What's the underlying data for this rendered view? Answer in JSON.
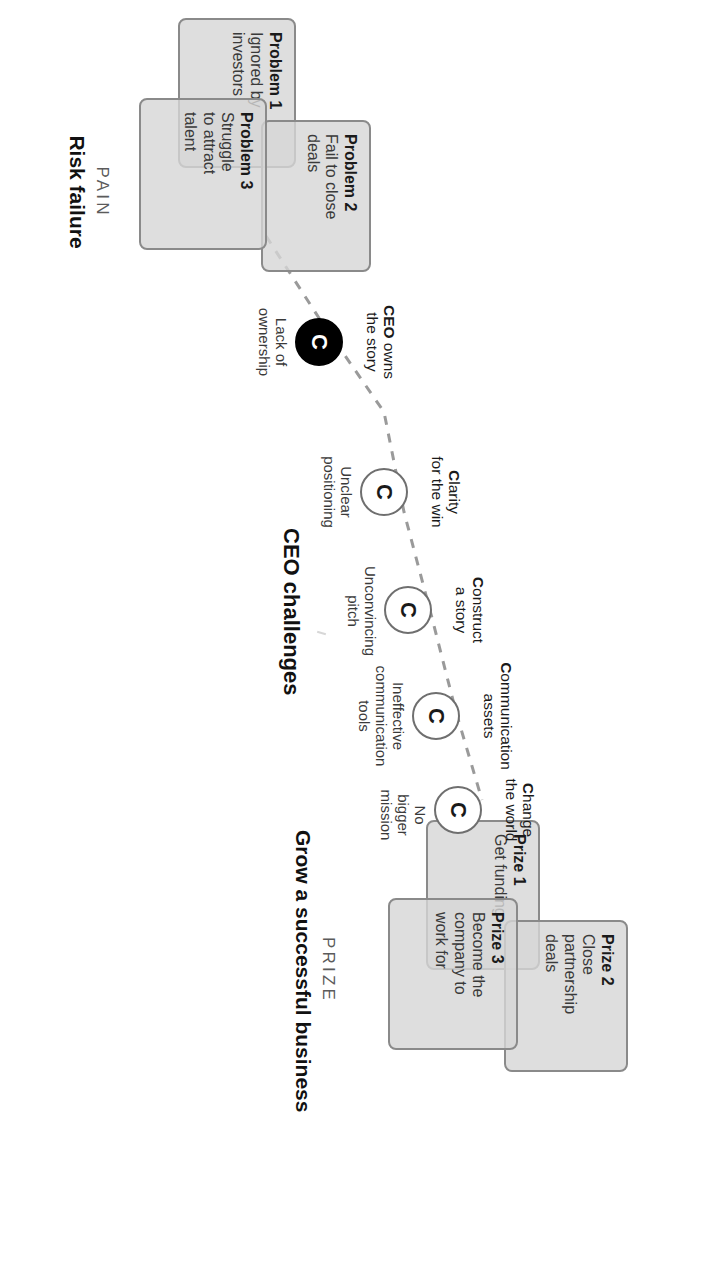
{
  "diagram": {
    "center_caption": "CEO challenges",
    "colors": {
      "card_fill": "#d6d6d6",
      "card_border": "#8a8a8a",
      "node_border": "#6f6f6f",
      "node_active_fill": "#000000",
      "connector": "#8f8f8f",
      "text": "#1a1a1a",
      "kicker": "#5b5b5b"
    },
    "nodes": [
      {
        "id": "ceo-owns-the-story",
        "glyph": "C",
        "filled": true,
        "label_lead": "CEO",
        "label_rest": " owns",
        "label_line2": "the story",
        "sub_line1": "Lack of",
        "sub_line2": "ownership"
      },
      {
        "id": "clarity-for-the-win",
        "glyph": "C",
        "filled": false,
        "label_lead": "C",
        "label_rest": "larity",
        "label_line2": "for the win",
        "sub_line1": "Unclear",
        "sub_line2": "positioning"
      },
      {
        "id": "construct-a-story",
        "glyph": "C",
        "filled": false,
        "label_lead": "C",
        "label_rest": "onstruct",
        "label_line2": "a story",
        "sub_line1": "Unconvincing",
        "sub_line2": "pitch"
      },
      {
        "id": "communication-assets",
        "glyph": "C",
        "filled": false,
        "label_lead": "C",
        "label_rest": "ommunication",
        "label_line2": "assets",
        "sub_line1": "Ineffective",
        "sub_line2": "communication",
        "sub_line3": "tools"
      },
      {
        "id": "change-the-world",
        "glyph": "C",
        "filled": false,
        "label_lead": "C",
        "label_rest": "hange",
        "label_line2": "the world",
        "sub_line1": "No",
        "sub_line2": "bigger",
        "sub_line3": "mission"
      }
    ],
    "pain": {
      "kicker": "PAIN",
      "headline": "Risk failure",
      "cards": [
        {
          "title": "Problem 1",
          "line1": "Ignored by",
          "line2": "investors"
        },
        {
          "title": "Problem 2",
          "line1": "Fail to close",
          "line2": "deals"
        },
        {
          "title": "Problem 3",
          "line1": "Struggle",
          "line2": "to attract",
          "line3": "talent"
        }
      ]
    },
    "prize": {
      "kicker": "PRIZE",
      "headline": "Grow a successful business",
      "cards": [
        {
          "title": "Prize 1",
          "line1": "Get funding"
        },
        {
          "title": "Prize 2",
          "line1": "Close",
          "line2": "partnership",
          "line3": "deals"
        },
        {
          "title": "Prize 3",
          "line1": "Become the",
          "line2": "company to",
          "line3": "work for"
        }
      ]
    }
  }
}
